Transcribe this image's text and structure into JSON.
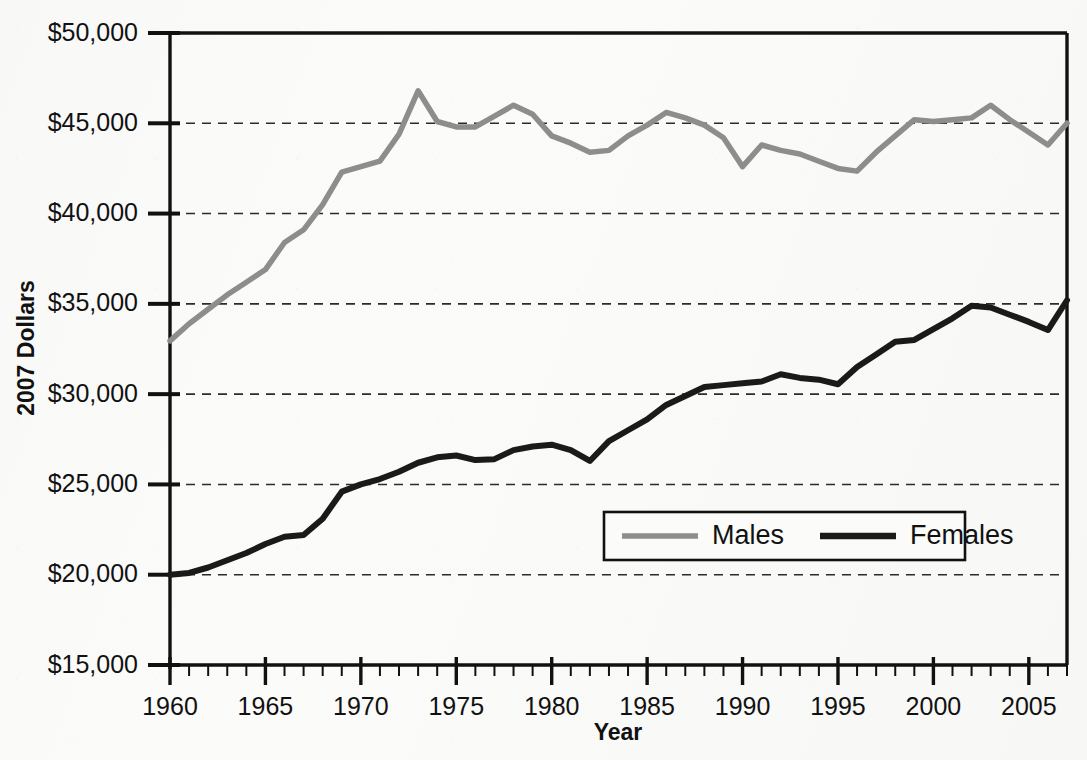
{
  "chart_data": {
    "type": "line",
    "title": "",
    "xlabel": "Year",
    "ylabel": "2007 Dollars",
    "xlim": [
      1960,
      2007
    ],
    "ylim": [
      15000,
      50000
    ],
    "ytick_labels": [
      "$50,000",
      "$45,000",
      "$40,000",
      "$35,000",
      "$30,000",
      "$25,000",
      "$20,000",
      "$15,000"
    ],
    "ytick_values": [
      50000,
      45000,
      40000,
      35000,
      30000,
      25000,
      20000,
      15000
    ],
    "xtick_labels": [
      "1960",
      "1965",
      "1970",
      "1975",
      "1980",
      "1985",
      "1990",
      "1995",
      "2000",
      "2005"
    ],
    "xtick_values": [
      1960,
      1965,
      1970,
      1975,
      1980,
      1985,
      1990,
      1995,
      2000,
      2005
    ],
    "x_minor_tick_step": 1,
    "grid": "horizontal-dashed",
    "legend_position": "inside-lower-right",
    "x": [
      1960,
      1961,
      1962,
      1963,
      1964,
      1965,
      1966,
      1967,
      1968,
      1969,
      1970,
      1971,
      1972,
      1973,
      1974,
      1975,
      1976,
      1977,
      1978,
      1979,
      1980,
      1981,
      1982,
      1983,
      1984,
      1985,
      1986,
      1987,
      1988,
      1989,
      1990,
      1991,
      1992,
      1993,
      1994,
      1995,
      1996,
      1997,
      1998,
      1999,
      2000,
      2001,
      2002,
      2003,
      2004,
      2005,
      2006,
      2007
    ],
    "series": [
      {
        "name": "Males",
        "color": "#8d8d8d",
        "values": [
          32950,
          33900,
          34700,
          35500,
          36200,
          36900,
          38400,
          39100,
          40500,
          42300,
          42600,
          42900,
          44400,
          46800,
          45100,
          44800,
          44800,
          45400,
          46000,
          45500,
          44300,
          43900,
          43400,
          43500,
          44300,
          44900,
          45600,
          45300,
          44900,
          44200,
          42600,
          43800,
          43500,
          43300,
          42900,
          42500,
          42350,
          43400,
          44300,
          45200,
          45100,
          45200,
          45300,
          46000,
          45200,
          44500,
          43800,
          45000
        ]
      },
      {
        "name": "Females",
        "color": "#1a1a1a",
        "values": [
          20000,
          20100,
          20400,
          20800,
          21200,
          21700,
          22100,
          22200,
          23100,
          24600,
          25000,
          25300,
          25700,
          26200,
          26500,
          26600,
          26350,
          26400,
          26900,
          27100,
          27200,
          26900,
          26300,
          27400,
          28000,
          28600,
          29400,
          29900,
          30400,
          30500,
          30600,
          30700,
          31100,
          30900,
          30800,
          30550,
          31500,
          32200,
          32900,
          33000,
          33600,
          34200,
          34900,
          34800,
          34400,
          34000,
          33550,
          35200
        ]
      }
    ],
    "legend": [
      {
        "label": "Males",
        "color": "#8d8d8d"
      },
      {
        "label": "Females",
        "color": "#1a1a1a"
      }
    ]
  },
  "axes": {
    "y_title": "2007 Dollars",
    "x_title": "Year"
  }
}
